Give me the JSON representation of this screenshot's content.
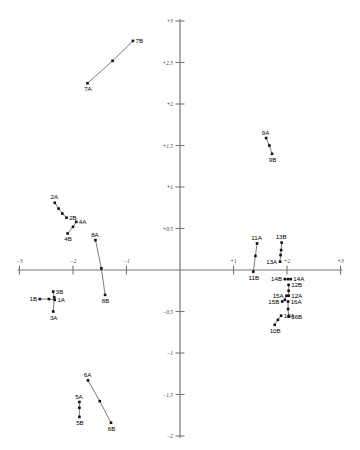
{
  "figure": {
    "type": "scatter-vector-plot",
    "background_color": "#ffffff",
    "axis_color": "#777777",
    "point_color": "#111111",
    "line_color": "#5a5a5a"
  },
  "chart_data": {
    "type": "scatter",
    "title": "",
    "subtitle": "",
    "xlabel": "",
    "ylabel": "",
    "xlim": [
      -3,
      3
    ],
    "ylim": [
      -2,
      3
    ],
    "grid": false,
    "legend": null,
    "axes": {
      "x_ticks": [
        -3,
        -2,
        -1,
        1,
        2,
        3
      ],
      "x_tick_labels": [
        "−3",
        "−2",
        "−1",
        "+1",
        "+2",
        "+3"
      ],
      "y_ticks": [
        -2,
        -1.5,
        -1,
        -0.5,
        0.5,
        1,
        1.5,
        2,
        2.5,
        3
      ],
      "y_tick_labels": [
        "−2",
        "−1.5",
        "−1",
        "−0.5",
        "+0.5",
        "+1",
        "+1.5",
        "+2",
        "+2.5",
        "+3"
      ],
      "origin": [
        0,
        0
      ]
    },
    "series": [
      {
        "name": "1",
        "points": [
          {
            "label": "1B",
            "x": -2.62,
            "y": -0.35,
            "label_pos": "left"
          },
          {
            "label": "",
            "x": -2.45,
            "y": -0.35,
            "label_pos": "none"
          },
          {
            "label": "1A",
            "x": -2.34,
            "y": -0.36,
            "label_pos": "right"
          }
        ]
      },
      {
        "name": "3",
        "points": [
          {
            "label": "3B",
            "x": -2.37,
            "y": -0.26,
            "label_pos": "right"
          },
          {
            "label": "",
            "x": -2.35,
            "y": -0.33,
            "label_pos": "none"
          },
          {
            "label": "3A",
            "x": -2.37,
            "y": -0.5,
            "label_pos": "below"
          }
        ]
      },
      {
        "name": "2",
        "points": [
          {
            "label": "2A",
            "x": -2.34,
            "y": 0.81,
            "label_pos": "above"
          },
          {
            "label": "",
            "x": -2.27,
            "y": 0.74,
            "label_pos": "none"
          },
          {
            "label": "",
            "x": -2.2,
            "y": 0.68,
            "label_pos": "none"
          },
          {
            "label": "2B",
            "x": -2.12,
            "y": 0.63,
            "label_pos": "right"
          }
        ]
      },
      {
        "name": "4",
        "points": [
          {
            "label": "4B",
            "x": -2.1,
            "y": 0.44,
            "label_pos": "below"
          },
          {
            "label": "",
            "x": -2.0,
            "y": 0.52,
            "label_pos": "none"
          },
          {
            "label": "4A",
            "x": -1.94,
            "y": 0.58,
            "label_pos": "right"
          }
        ]
      },
      {
        "name": "8",
        "points": [
          {
            "label": "8A",
            "x": -1.58,
            "y": 0.36,
            "label_pos": "above"
          },
          {
            "label": "",
            "x": -1.47,
            "y": 0.02,
            "label_pos": "none"
          },
          {
            "label": "8B",
            "x": -1.4,
            "y": -0.3,
            "label_pos": "below"
          }
        ]
      },
      {
        "name": "7",
        "points": [
          {
            "label": "7A",
            "x": -1.73,
            "y": 2.25,
            "label_pos": "below"
          },
          {
            "label": "",
            "x": -1.26,
            "y": 2.52,
            "label_pos": "none"
          },
          {
            "label": "7B",
            "x": -0.88,
            "y": 2.76,
            "label_pos": "right"
          }
        ]
      },
      {
        "name": "5",
        "points": [
          {
            "label": "5A",
            "x": -1.88,
            "y": -1.59,
            "label_pos": "above"
          },
          {
            "label": "",
            "x": -1.88,
            "y": -1.66,
            "label_pos": "none"
          },
          {
            "label": "5B",
            "x": -1.88,
            "y": -1.77,
            "label_pos": "below"
          }
        ]
      },
      {
        "name": "6",
        "points": [
          {
            "label": "6A",
            "x": -1.72,
            "y": -1.33,
            "label_pos": "above"
          },
          {
            "label": "",
            "x": -1.5,
            "y": -1.58,
            "label_pos": "none"
          },
          {
            "label": "6B",
            "x": -1.29,
            "y": -1.84,
            "label_pos": "below"
          }
        ]
      },
      {
        "name": "9",
        "points": [
          {
            "label": "9A",
            "x": 1.61,
            "y": 1.59,
            "label_pos": "above"
          },
          {
            "label": "",
            "x": 1.67,
            "y": 1.5,
            "label_pos": "none"
          },
          {
            "label": "9B",
            "x": 1.72,
            "y": 1.4,
            "label_pos": "below"
          }
        ]
      },
      {
        "name": "11",
        "points": [
          {
            "label": "11A",
            "x": 1.44,
            "y": 0.32,
            "label_pos": "above"
          },
          {
            "label": "",
            "x": 1.41,
            "y": 0.17,
            "label_pos": "none"
          },
          {
            "label": "11B",
            "x": 1.37,
            "y": -0.02,
            "label_pos": "below"
          }
        ]
      },
      {
        "name": "13",
        "points": [
          {
            "label": "13B",
            "x": 1.9,
            "y": 0.33,
            "label_pos": "above"
          },
          {
            "label": "",
            "x": 1.89,
            "y": 0.24,
            "label_pos": "none"
          },
          {
            "label": "",
            "x": 1.88,
            "y": 0.18,
            "label_pos": "none"
          },
          {
            "label": "13A",
            "x": 1.87,
            "y": 0.1,
            "label_pos": "left"
          }
        ]
      },
      {
        "name": "14",
        "points": [
          {
            "label": "14B",
            "x": 1.96,
            "y": -0.11,
            "label_pos": "left"
          },
          {
            "label": "",
            "x": 2.02,
            "y": -0.11,
            "label_pos": "none"
          },
          {
            "label": "14A",
            "x": 2.07,
            "y": -0.11,
            "label_pos": "right"
          }
        ]
      },
      {
        "name": "12",
        "points": [
          {
            "label": "12B",
            "x": 2.03,
            "y": -0.18,
            "label_pos": "right"
          },
          {
            "label": "",
            "x": 2.03,
            "y": -0.25,
            "label_pos": "none"
          },
          {
            "label": "12A",
            "x": 2.03,
            "y": -0.31,
            "label_pos": "right"
          }
        ]
      },
      {
        "name": "15",
        "points": [
          {
            "label": "15A",
            "x": 1.99,
            "y": -0.31,
            "label_pos": "left"
          },
          {
            "label": "",
            "x": 1.96,
            "y": -0.36,
            "label_pos": "none"
          },
          {
            "label": "15B",
            "x": 1.91,
            "y": -0.38,
            "label_pos": "left"
          }
        ]
      },
      {
        "name": "16",
        "points": [
          {
            "label": "16A",
            "x": 2.02,
            "y": -0.38,
            "label_pos": "right"
          },
          {
            "label": "",
            "x": 2.02,
            "y": -0.47,
            "label_pos": "none"
          },
          {
            "label": "16B",
            "x": 2.03,
            "y": -0.56,
            "label_pos": "right"
          }
        ]
      },
      {
        "name": "10",
        "points": [
          {
            "label": "10A",
            "x": 1.89,
            "y": -0.55,
            "label_pos": "right"
          },
          {
            "label": "",
            "x": 1.83,
            "y": -0.6,
            "label_pos": "none"
          },
          {
            "label": "10B",
            "x": 1.77,
            "y": -0.66,
            "label_pos": "below"
          }
        ]
      }
    ]
  }
}
